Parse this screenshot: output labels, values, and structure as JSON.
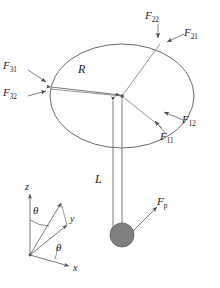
{
  "figure": {
    "colors": {
      "stroke": "#6b6b6b",
      "text": "#1a1a1a",
      "bob_fill": "#808080",
      "bob_stroke": "#5a5a5a",
      "background": "#ffffff"
    },
    "disk": {
      "center": [
        122,
        96
      ],
      "radius_x": 72,
      "radius_y": 52
    }
  },
  "forces": [
    {
      "id": "F11",
      "base": "F",
      "sub": "11",
      "x": 168,
      "y": 137,
      "arrow_from": [
        166,
        134
      ],
      "arrow_to": [
        154,
        120
      ]
    },
    {
      "id": "F12",
      "base": "F",
      "sub": "12",
      "x": 185,
      "y": 122,
      "arrow_from": [
        183,
        120
      ],
      "arrow_to": [
        163,
        111
      ]
    },
    {
      "id": "F21",
      "base": "F",
      "sub": "21",
      "x": 186,
      "y": 34,
      "arrow_from": [
        184,
        33
      ],
      "arrow_to": [
        166,
        41
      ]
    },
    {
      "id": "F22",
      "base": "F",
      "sub": "22",
      "x": 148,
      "y": 17,
      "arrow_from": [
        158,
        23
      ],
      "arrow_to": [
        158,
        37
      ]
    },
    {
      "id": "F31",
      "base": "F",
      "sub": "31",
      "x": 6,
      "y": 66,
      "arrow_from": [
        28,
        70
      ],
      "arrow_to": [
        47,
        83
      ]
    },
    {
      "id": "F32",
      "base": "F",
      "sub": "32",
      "x": 6,
      "y": 93,
      "arrow_from": [
        28,
        96
      ],
      "arrow_to": [
        47,
        91
      ]
    },
    {
      "id": "Fp",
      "base": "F",
      "sub": "p",
      "x": 160,
      "y": 203,
      "arrow_from": [
        133,
        231
      ],
      "arrow_to": [
        157,
        207
      ]
    }
  ],
  "dimensions": [
    {
      "id": "R",
      "label": "R",
      "x": 80,
      "y": 70,
      "from": [
        50,
        87
      ],
      "to": [
        120,
        96
      ]
    },
    {
      "id": "L",
      "label": "L",
      "x": 97,
      "y": 180,
      "from": [
        113,
        101
      ],
      "to": [
        113,
        233
      ]
    }
  ],
  "axes": {
    "origin": [
      30,
      255
    ],
    "items": [
      {
        "id": "z",
        "label": "z",
        "x": 26,
        "y": 186,
        "to": [
          30,
          193
        ]
      },
      {
        "id": "y",
        "label": "y",
        "x": 72,
        "y": 219,
        "to": [
          68,
          224
        ]
      },
      {
        "id": "x",
        "label": "x",
        "x": 75,
        "y": 268,
        "to": [
          70,
          265
        ]
      },
      {
        "id": "r",
        "label": "",
        "x": 0,
        "y": 0,
        "to": [
          62,
          202
        ]
      }
    ],
    "angles": [
      {
        "id": "theta-polar",
        "label": "θ",
        "x": 36,
        "y": 211
      },
      {
        "id": "theta-azimuth",
        "label": "θ",
        "x": 58,
        "y": 248
      }
    ]
  },
  "pendulum": {
    "string_from": [
      122,
      96
    ],
    "string_to": [
      122,
      223
    ],
    "bob_center": [
      122,
      235
    ],
    "bob_radius": 12
  }
}
